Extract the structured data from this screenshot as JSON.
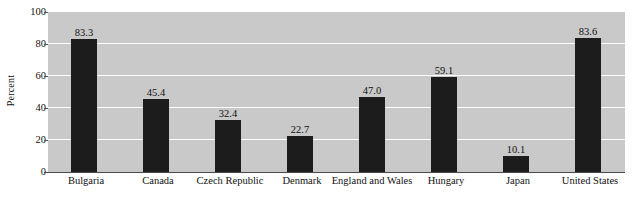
{
  "chart_data": {
    "type": "bar",
    "title": "",
    "xlabel": "",
    "ylabel": "Percent",
    "ylim": [
      0,
      100
    ],
    "yticks": [
      0,
      20,
      40,
      60,
      80,
      100
    ],
    "grid": true,
    "legend": "none",
    "categories": [
      "Bulgaria",
      "Canada",
      "Czech Republic",
      "Denmark",
      "England and Wales",
      "Hungary",
      "Japan",
      "United States"
    ],
    "values": [
      83.3,
      45.4,
      32.4,
      22.7,
      47.0,
      59.1,
      10.1,
      83.6
    ],
    "value_labels": [
      "83.3",
      "45.4",
      "32.4",
      "22.7",
      "47.0",
      "59.1",
      "10.1",
      "83.6"
    ],
    "tick_labels": [
      "100",
      "80",
      "60",
      "40",
      "20",
      "0"
    ],
    "colors": {
      "bar": "#1c1c1c",
      "plot_background": "#c9c9c9",
      "gridline": "#fdfdfd",
      "page_background": "#ffffff",
      "text": "#111111",
      "axis": "#4a4a4a"
    }
  }
}
